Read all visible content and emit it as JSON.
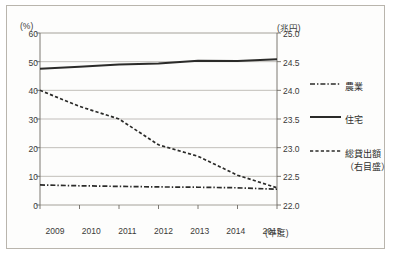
{
  "chart_data": {
    "type": "line",
    "title": "",
    "xlabel": "(年度)",
    "ylabel": "(%)",
    "y2label": "(兆円)",
    "categories": [
      "2009",
      "2010",
      "2011",
      "2012",
      "2013",
      "2014",
      "2015"
    ],
    "x": [
      2009,
      2010,
      2011,
      2012,
      2013,
      2014,
      2015
    ],
    "ylim": [
      0,
      60
    ],
    "yticks": [
      "0",
      "10",
      "20",
      "30",
      "40",
      "50",
      "60"
    ],
    "y2lim": [
      22.0,
      25.0
    ],
    "y2ticks": [
      "22.0",
      "22.5",
      "23.0",
      "23.5",
      "24.0",
      "24.5",
      "25.0"
    ],
    "grid": true,
    "legend_position": "right",
    "series": [
      {
        "name": "農業",
        "axis": "left",
        "style": "dash-dot",
        "unit": "%",
        "values": [
          7.0,
          6.7,
          6.5,
          6.3,
          6.2,
          6.0,
          5.5
        ]
      },
      {
        "name": "住宅",
        "axis": "left",
        "style": "solid",
        "unit": "%",
        "values": [
          47.5,
          48.2,
          49.0,
          49.4,
          50.3,
          50.2,
          50.8
        ]
      },
      {
        "name": "総貸出額",
        "axis": "right",
        "style": "dashed",
        "unit": "兆円",
        "values": [
          24.0,
          23.72,
          23.5,
          23.05,
          22.85,
          22.52,
          22.3
        ]
      }
    ]
  },
  "axes": {
    "left_unit": "(%)",
    "right_unit": "(兆円)",
    "x_unit": "(年度)"
  },
  "legend": {
    "items": [
      {
        "label": "農業",
        "note": "",
        "marker": "dash-dot-line-icon"
      },
      {
        "label": "住宅",
        "note": "",
        "marker": "solid-line-icon"
      },
      {
        "label": "総貸出額",
        "note": "（右目盛）",
        "marker": "dashed-line-icon"
      }
    ]
  },
  "colors": {
    "line": "#2b2b29",
    "grid": "#9a968e",
    "axis": "#6e6a63",
    "frame": "#b9b5ad",
    "text": "#3a3a38",
    "background": "#fdfdfc"
  }
}
